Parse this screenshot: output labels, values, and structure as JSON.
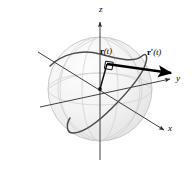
{
  "figure": {
    "background_color": "#ffffff",
    "stroke_color": "#000000",
    "sphere": {
      "name": "sphere",
      "center": {
        "x": 100,
        "y": 89
      },
      "radius": 52,
      "fill_color": "#f1f1f1",
      "outline_color": "#c9c9c9",
      "highlight_color": "#fbfbfb"
    },
    "axes": [
      {
        "id": "z",
        "label": "z",
        "label_x": 99,
        "label_y": 5,
        "interactable": false
      },
      {
        "id": "y",
        "label": "y",
        "label_x": 176,
        "label_y": 74,
        "interactable": false
      },
      {
        "id": "x",
        "label": "x",
        "label_x": 168,
        "label_y": 124,
        "interactable": false
      }
    ],
    "vectors": [
      {
        "id": "position-vector",
        "label_bold": "r",
        "label_prime": "",
        "label_arg": "(t)",
        "label_x": 100,
        "label_y": 47,
        "from": {
          "x": 100,
          "y": 89
        },
        "to": {
          "x": 108,
          "y": 63
        }
      },
      {
        "id": "tangent-vector",
        "label_bold": "r",
        "label_prime": "′",
        "label_arg": "(t)",
        "label_x": 147,
        "label_y": 48,
        "from": {
          "x": 108,
          "y": 64
        },
        "to": {
          "x": 172,
          "y": 73
        }
      }
    ],
    "right_angle_marker": {
      "id": "right-angle-marker",
      "x": 106,
      "y": 62,
      "size": 8
    },
    "curve": {
      "id": "space-curve",
      "color": "#3a3a3a",
      "width": 1.4
    }
  }
}
